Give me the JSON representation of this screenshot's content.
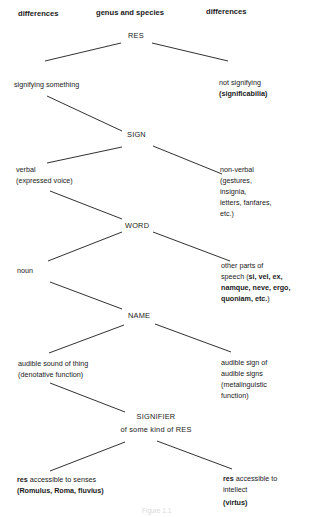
{
  "headers": {
    "left": "differences",
    "center": "genus and species",
    "right": "differences"
  },
  "nodes": {
    "res": "RES",
    "sign": "SIGN",
    "word": "WORD",
    "name": "NAME",
    "signifier_line1": "SIGNIFIER",
    "signifier_line2": "of some kind of RES"
  },
  "left_branches": {
    "res": {
      "line1": "signifying something"
    },
    "sign": {
      "line1": "verbal",
      "line2": "(expressed voice)"
    },
    "word": {
      "line1": "noun"
    },
    "name": {
      "line1": "audible sound of thing",
      "line2": "(denotative function)"
    },
    "signifier": {
      "line1_bold": "res",
      "line1_rest": " accessible to senses",
      "line2": "(Romulus, Roma, fluvius)"
    }
  },
  "right_branches": {
    "res": {
      "line1": "not signifying",
      "line2": "(significabilia)"
    },
    "sign": {
      "line1": "non-verbal",
      "line2": "(gestures,",
      "line3": "insignia,",
      "line4": "letters, fanfares,",
      "line5": "etc.)"
    },
    "word": {
      "line1": "other parts of",
      "line2_pre": "speech (",
      "line2_bold": "si, vel, ex,",
      "line3_bold": "namque, neve, ergo,",
      "line4_bold": "quoniam, etc.",
      "line4_post": ")"
    },
    "name": {
      "line1": "audible sign of",
      "line2": "audible signs",
      "line3": "(metalinguistic",
      "line4": "function)"
    },
    "signifier": {
      "line1_bold": "res",
      "line1_rest": " accessible to",
      "line2": "intellect",
      "line3": "(virtus)"
    }
  },
  "caption": "Figure 1.1"
}
